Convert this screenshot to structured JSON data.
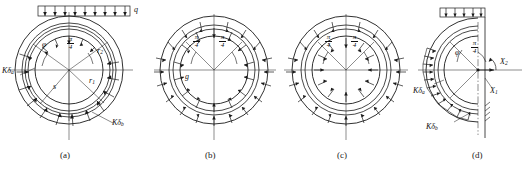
{
  "figure": {
    "title_visible": false,
    "panel_count": 4,
    "background": "#ffffff",
    "line_color": "#1a1a1a"
  },
  "panels": [
    {
      "id": "a",
      "caption": "(a)",
      "description": "circular ring with uniform vertical surcharge q on top and elastic resistance arrows around lower circumference",
      "labels": {
        "load": "q",
        "angle_phi": "φ",
        "angle_pi_num": "π",
        "angle_pi_den": "4",
        "radius_outer": "r",
        "radius_outer_sub": "2",
        "radius_inner": "r",
        "radius_inner_sub": "1",
        "resist_a": "Kδ",
        "resist_a_sub": "a",
        "resist_b": "Kδ",
        "resist_b_sub": "b",
        "arc_label": "s"
      }
    },
    {
      "id": "b",
      "caption": "(b)",
      "description": "circular ring with self weight g and radial arrows distributed around the ring",
      "labels": {
        "self_weight": "g",
        "angle_left_num": "π",
        "angle_left_den": "4",
        "angle_right_num": "π",
        "angle_right_den": "4"
      }
    },
    {
      "id": "c",
      "caption": "(c)",
      "description": "circular ring with inward radial pressure arrows around the full circumference",
      "labels": {
        "angle_left_num": "π",
        "angle_left_den": "4",
        "angle_right_num": "π",
        "angle_right_den": "4"
      }
    },
    {
      "id": "d",
      "caption": "(d)",
      "description": "half ring model with surcharge on top, redundant forces X1 and X2 at the crown axis and elastic resistance on the left side",
      "labels": {
        "force_x2": "X",
        "force_x2_sub": "2",
        "force_x1": "X",
        "force_x1_sub": "1",
        "angle_phi": "φ",
        "angle_pi_num": "π",
        "angle_pi_den": "4",
        "resist_a": "Kδ",
        "resist_a_sub": "a",
        "resist_b": "Kδ",
        "resist_b_sub": "b"
      }
    }
  ]
}
